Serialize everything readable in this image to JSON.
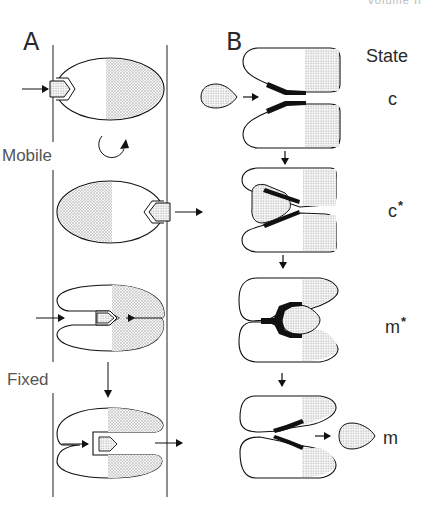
{
  "header": {
    "text": "Volume II"
  },
  "panels": {
    "a": {
      "label": "A"
    },
    "b": {
      "label": "B"
    }
  },
  "panel_a": {
    "transitions": [
      {
        "label": "Mobile",
        "icon": "rotate-clockwise-arrow-icon"
      },
      {
        "label": "Fixed",
        "icon": "down-arrow-icon"
      }
    ],
    "rows": [
      {
        "description": "Ellipsoid carrier with pentagon substrate entering from left through membrane"
      },
      {
        "description": "Rotated carrier releasing pentagon substrate to right"
      },
      {
        "description": "Clam-shaped carrier with substrate bound in channel, arrow in from left"
      },
      {
        "description": "Clam-shaped carrier with substrate in open box channel, arrow out to right"
      }
    ]
  },
  "panel_b": {
    "title": "State",
    "states": [
      {
        "symbol": "c",
        "star": ""
      },
      {
        "symbol": "c",
        "star": "*"
      },
      {
        "symbol": "m",
        "star": "*"
      },
      {
        "symbol": "m",
        "star": ""
      }
    ]
  },
  "colors": {
    "line": "#1a1a1a",
    "stipple": "#bdbdbd",
    "background": "#ffffff",
    "label": "#2a2a2a"
  }
}
